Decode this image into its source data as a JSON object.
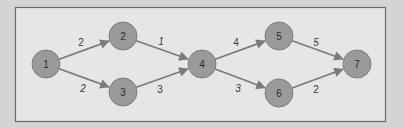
{
  "diagram": {
    "type": "directed-network",
    "nodes": [
      {
        "id": "1",
        "label": "1"
      },
      {
        "id": "2",
        "label": "2"
      },
      {
        "id": "3",
        "label": "3"
      },
      {
        "id": "4",
        "label": "4"
      },
      {
        "id": "5",
        "label": "5"
      },
      {
        "id": "6",
        "label": "6"
      },
      {
        "id": "7",
        "label": "7"
      }
    ],
    "edges": [
      {
        "from": "1",
        "to": "2",
        "label": "2"
      },
      {
        "from": "1",
        "to": "3",
        "label": "2"
      },
      {
        "from": "2",
        "to": "4",
        "label": "1"
      },
      {
        "from": "3",
        "to": "4",
        "label": "3"
      },
      {
        "from": "4",
        "to": "5",
        "label": "4"
      },
      {
        "from": "4",
        "to": "6",
        "label": "3"
      },
      {
        "from": "5",
        "to": "7",
        "label": "5"
      },
      {
        "from": "6",
        "to": "7",
        "label": "2"
      }
    ],
    "colors": {
      "background": "#d4d4d4",
      "panel": "#e6e6e6",
      "node_fill": "#9a9a9a",
      "edge": "#7a7a7a",
      "text": "#2a2a2a"
    }
  }
}
